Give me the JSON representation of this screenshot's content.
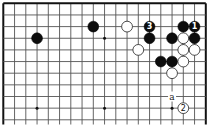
{
  "diagram": {
    "type": "go-board-fragment",
    "visible_region": "top-right corner (top and right edges shown)",
    "columns_visible": 19,
    "rows_visible": 11,
    "colors": {
      "black": "#0d0d0d",
      "white": "#ffffff",
      "grid": "#555555"
    },
    "hoshi": [
      {
        "col": 3,
        "row": 9
      },
      {
        "col": 9,
        "row": 3
      },
      {
        "col": 9,
        "row": 9
      },
      {
        "col": 15,
        "row": 9
      }
    ],
    "stones": [
      {
        "color": "black",
        "col": 3,
        "row": 3,
        "label": ""
      },
      {
        "color": "black",
        "col": 8,
        "row": 2,
        "label": ""
      },
      {
        "color": "white",
        "col": 11,
        "row": 2,
        "label": ""
      },
      {
        "color": "black",
        "col": 13,
        "row": 2,
        "label": "3"
      },
      {
        "color": "black",
        "col": 13,
        "row": 3,
        "label": ""
      },
      {
        "color": "white",
        "col": 12,
        "row": 4,
        "label": ""
      },
      {
        "color": "black",
        "col": 16,
        "row": 2,
        "label": ""
      },
      {
        "color": "black",
        "col": 17,
        "row": 2,
        "label": "1"
      },
      {
        "color": "black",
        "col": 15,
        "row": 3,
        "label": ""
      },
      {
        "color": "white",
        "col": 16,
        "row": 3,
        "label": ""
      },
      {
        "color": "black",
        "col": 17,
        "row": 3,
        "label": ""
      },
      {
        "color": "white",
        "col": 16,
        "row": 4,
        "label": ""
      },
      {
        "color": "white",
        "col": 17,
        "row": 4,
        "label": ""
      },
      {
        "color": "black",
        "col": 14,
        "row": 5,
        "label": ""
      },
      {
        "color": "black",
        "col": 15,
        "row": 5,
        "label": ""
      },
      {
        "color": "white",
        "col": 16,
        "row": 5,
        "label": ""
      },
      {
        "color": "white",
        "col": 15,
        "row": 6,
        "label": ""
      },
      {
        "color": "white",
        "col": 16,
        "row": 9,
        "label": "2"
      }
    ],
    "point_labels": [
      {
        "text": "a",
        "col": 15,
        "row": 8
      }
    ],
    "move_sequence": [
      {
        "move": "1",
        "color": "black"
      },
      {
        "move": "2",
        "color": "white"
      },
      {
        "move": "3",
        "color": "black"
      }
    ]
  }
}
